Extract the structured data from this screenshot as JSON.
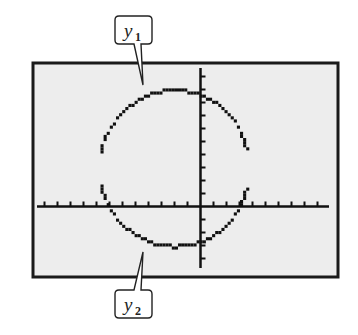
{
  "figure": {
    "type": "graphing-calculator-screen",
    "screen_bg": "#ededed",
    "frame_color": "#1a1a1a",
    "curve_color": "#111111"
  },
  "labels": {
    "upper": {
      "var": "y",
      "sub": "1"
    },
    "lower": {
      "var": "y",
      "sub": "2"
    }
  },
  "axes": {
    "x_ticks_each_side_left": 12,
    "x_ticks_each_side_right": 10,
    "y_ticks_above": 11,
    "y_ticks_below": 4
  },
  "chart_data": {
    "type": "line",
    "title": "",
    "series": [
      {
        "name": "y1",
        "description": "upper semicircle"
      },
      {
        "name": "y2",
        "description": "lower semicircle"
      }
    ],
    "shape": "circle",
    "center_approx_units": [
      -2,
      3
    ],
    "radius_approx_units": 6,
    "grid": false,
    "legend": "callout labels y1 (top) and y2 (bottom)",
    "note": "Gaps appear near the left and right extremes where the calculator pixels miss the near-vertical portions"
  }
}
